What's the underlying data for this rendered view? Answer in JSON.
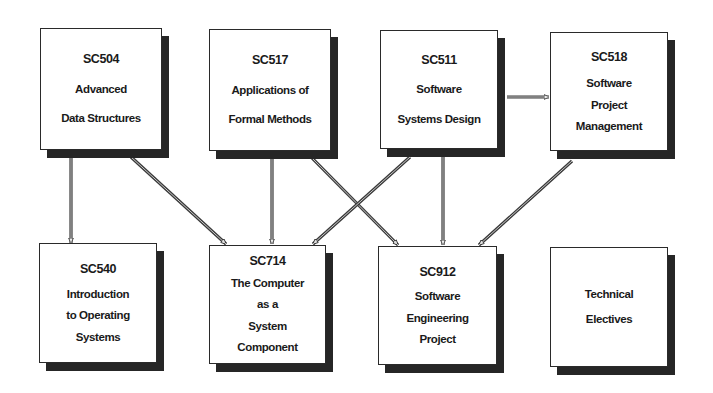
{
  "diagram": {
    "type": "course-prerequisite-flow",
    "nodes": [
      {
        "id": "SC504",
        "code": "SC504",
        "lines": [
          "Advanced",
          "Data Structures"
        ],
        "x": 40,
        "y": 28,
        "w": 122,
        "h": 122,
        "row": 1
      },
      {
        "id": "SC517",
        "code": "SC517",
        "lines": [
          "Applications of",
          "Formal Methods"
        ],
        "x": 209,
        "y": 29,
        "w": 122,
        "h": 122,
        "row": 1
      },
      {
        "id": "SC511",
        "code": "SC511",
        "lines": [
          "Software",
          "Systems Design"
        ],
        "x": 380,
        "y": 30,
        "w": 118,
        "h": 119,
        "row": 1
      },
      {
        "id": "SC518",
        "code": "SC518",
        "lines": [
          "Software",
          "Project",
          "Management"
        ],
        "x": 550,
        "y": 32,
        "w": 118,
        "h": 119,
        "row": 1
      },
      {
        "id": "SC540",
        "code": "SC540",
        "lines": [
          "Introduction",
          "to Operating",
          "Systems"
        ],
        "x": 39,
        "y": 243,
        "w": 118,
        "h": 120,
        "row": 2
      },
      {
        "id": "SC714",
        "code": "SC714",
        "lines": [
          "The Computer",
          "as a",
          "System",
          "Component"
        ],
        "x": 209,
        "y": 245,
        "w": 117,
        "h": 119,
        "row": 2
      },
      {
        "id": "SC912",
        "code": "SC912",
        "lines": [
          "Software",
          "Engineering",
          "Project"
        ],
        "x": 378,
        "y": 246,
        "w": 119,
        "h": 119,
        "row": 2
      },
      {
        "id": "TECH",
        "code": "",
        "lines": [
          "Technical",
          "Electives"
        ],
        "x": 550,
        "y": 247,
        "w": 118,
        "h": 120,
        "row": 2
      }
    ],
    "edges": [
      {
        "from": "SC504",
        "to": "SC540",
        "x1": 71,
        "y1": 157,
        "x2": 71,
        "y2": 243
      },
      {
        "from": "SC504",
        "to": "SC714",
        "x1": 131,
        "y1": 157,
        "x2": 226,
        "y2": 244
      },
      {
        "from": "SC517",
        "to": "SC714",
        "x1": 272,
        "y1": 158,
        "x2": 272,
        "y2": 244
      },
      {
        "from": "SC517",
        "to": "SC912",
        "x1": 312,
        "y1": 158,
        "x2": 398,
        "y2": 245
      },
      {
        "from": "SC511",
        "to": "SC714",
        "x1": 410,
        "y1": 157,
        "x2": 313,
        "y2": 244
      },
      {
        "from": "SC511",
        "to": "SC912",
        "x1": 443,
        "y1": 157,
        "x2": 443,
        "y2": 245
      },
      {
        "from": "SC511",
        "to": "SC518",
        "x1": 507,
        "y1": 97,
        "x2": 549,
        "y2": 97
      },
      {
        "from": "SC518",
        "to": "SC912",
        "x1": 572,
        "y1": 161,
        "x2": 479,
        "y2": 245
      }
    ]
  },
  "colors": {
    "box_border": "#2a2a2a",
    "box_shadow": "#262626",
    "arrow": "#3a3a3a",
    "background": "#ffffff"
  }
}
